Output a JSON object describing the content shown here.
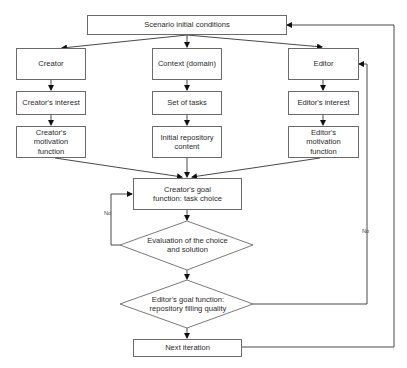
{
  "diagram": {
    "type": "flowchart",
    "nodes": {
      "start": "Scenario initial conditions",
      "creator": "Creator",
      "context": "Context (domain)",
      "editor": "Editor",
      "creator_interest": "Creator's interest",
      "set_of_tasks": "Set of tasks",
      "editor_interest": "Editor's interest",
      "creator_motivation": "Creator's motivation function",
      "initial_repository": "Initial repository content",
      "editor_motivation": "Editor's motivation function",
      "creator_goal": "Creator's goal function: task choice",
      "evaluation": "Evaluation of the choice and solution",
      "editor_goal": "Editor's goal function: repository filling quality",
      "next_iteration": "Next iteration"
    },
    "edge_labels": {
      "evaluation_no": "No",
      "editor_goal_no": "No"
    },
    "edges": [
      [
        "start",
        "creator"
      ],
      [
        "start",
        "context"
      ],
      [
        "start",
        "editor"
      ],
      [
        "creator",
        "creator_interest"
      ],
      [
        "creator_interest",
        "creator_motivation"
      ],
      [
        "context",
        "set_of_tasks"
      ],
      [
        "set_of_tasks",
        "initial_repository"
      ],
      [
        "editor",
        "editor_interest"
      ],
      [
        "editor_interest",
        "editor_motivation"
      ],
      [
        "creator_motivation",
        "creator_goal"
      ],
      [
        "initial_repository",
        "creator_goal"
      ],
      [
        "editor_motivation",
        "creator_goal"
      ],
      [
        "creator_goal",
        "evaluation"
      ],
      [
        "evaluation",
        "creator_goal",
        "No"
      ],
      [
        "evaluation",
        "editor_goal"
      ],
      [
        "editor_goal",
        "editor",
        "No"
      ],
      [
        "editor_goal",
        "next_iteration"
      ],
      [
        "next_iteration",
        "start"
      ]
    ]
  }
}
